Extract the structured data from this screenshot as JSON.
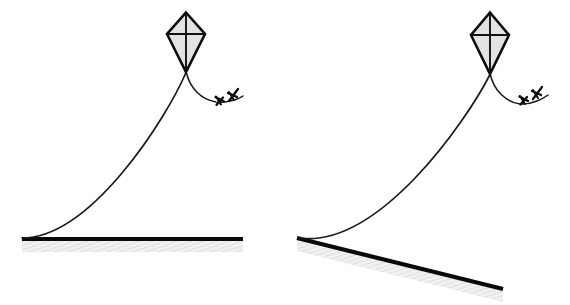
{
  "figure": {
    "background_color": "#ffffff",
    "width": 570,
    "height": 305,
    "panel_count": 2,
    "ink_color": "#111111",
    "kite_fill_color": "#e3e3e3",
    "ground_hatch_color": "#ececec"
  },
  "panels": [
    {
      "id": "left-panel",
      "name": "horizontal-ground-kite",
      "ground": {
        "label": "horizontal ground",
        "orientation": "horizontal",
        "slope_degrees": 0,
        "x1": 22,
        "y1": 239,
        "x2": 243,
        "y2": 239,
        "hatch_depth": 11
      },
      "kite": {
        "label": "kite",
        "center_x": 186,
        "top_y": 12,
        "bottom_y": 72,
        "half_width": 19,
        "waist_y": 34,
        "fill": "#e3e3e3"
      },
      "string": {
        "label": "kite string",
        "anchor_x": 22,
        "anchor_y": 238,
        "tangent_x": 60,
        "attach_x": 186,
        "attach_y": 72
      },
      "tail": {
        "label": "kite tail with ribbons",
        "start_x": 186,
        "start_y": 72,
        "end_x": 243,
        "end_y": 101,
        "bow_count": 2
      }
    },
    {
      "id": "right-panel",
      "name": "sloped-ground-kite",
      "ground": {
        "label": "sloped ground",
        "orientation": "sloped-down-right",
        "slope_degrees": 12,
        "x1": 297,
        "y1": 238,
        "x2": 503,
        "y2": 289,
        "hatch_depth": 11
      },
      "kite": {
        "label": "kite",
        "center_x": 490,
        "top_y": 12,
        "bottom_y": 74,
        "half_width": 19,
        "waist_y": 35,
        "fill": "#e3e3e3"
      },
      "string": {
        "label": "kite string",
        "anchor_x": 298,
        "anchor_y": 238,
        "tangent_x": 335,
        "attach_x": 490,
        "attach_y": 74
      },
      "tail": {
        "label": "kite tail with ribbons",
        "start_x": 490,
        "start_y": 74,
        "end_x": 548,
        "end_y": 100,
        "bow_count": 2
      }
    }
  ]
}
